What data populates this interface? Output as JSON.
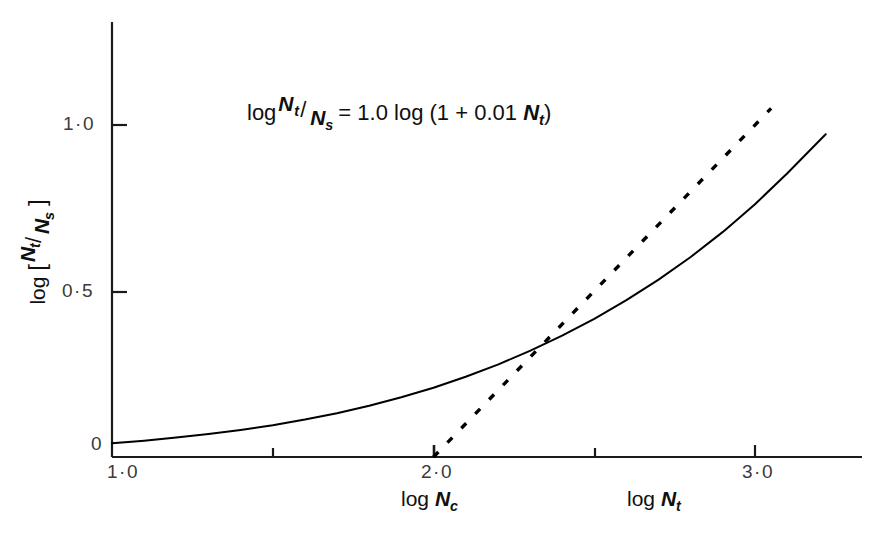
{
  "chart_data": {
    "type": "line",
    "title": "",
    "equation": {
      "lhs_log": "log",
      "lhs_num": "N",
      "lhs_num_sub": "t",
      "lhs_slash": "/",
      "lhs_den": "N",
      "lhs_den_sub": "s",
      "equals": "=",
      "coefficient": "1.0",
      "rhs_log": "log",
      "rhs_body": "(1 + 0.01 ",
      "rhs_var": "N",
      "rhs_var_sub": "t",
      "rhs_close": ")",
      "full_text": "log Nt/Ns = 1.0 log (1 + 0.01 Nt)"
    },
    "xlabel_primary": "log",
    "xlabel_primary_var": "N",
    "xlabel_primary_sub": "t",
    "xlabel_secondary": "log",
    "xlabel_secondary_var": "N",
    "xlabel_secondary_sub": "c",
    "ylabel_log": "log",
    "ylabel_open": "[",
    "ylabel_num": "N",
    "ylabel_num_sub": "t",
    "ylabel_slash": "/",
    "ylabel_den": "N",
    "ylabel_den_sub": "s",
    "ylabel_close": "]",
    "ylabel_full": "log [ Nt/Ns ]",
    "xlim": [
      1.0,
      3.22
    ],
    "ylim": [
      0.0,
      1.26
    ],
    "x_major_ticks": [
      "1·0",
      "2·0",
      "3·0"
    ],
    "x_major_values": [
      1.0,
      2.0,
      3.0
    ],
    "x_minor_values": [
      1.5,
      2.5
    ],
    "y_major_ticks": [
      "0",
      "0·5",
      "1·0"
    ],
    "y_major_values": [
      0.0,
      0.5,
      1.0
    ],
    "grid": false,
    "legend": "none",
    "series": [
      {
        "name": "log(1 + 0.01 Nt)",
        "style": "solid",
        "color": "#000000",
        "x": [
          1.0,
          1.1,
          1.2,
          1.3,
          1.4,
          1.5,
          1.6,
          1.7,
          1.8,
          1.9,
          2.0,
          2.1,
          2.2,
          2.3,
          2.4,
          2.5,
          2.6,
          2.7,
          2.8,
          2.9,
          3.0,
          3.1,
          3.22
        ],
        "values": [
          0.0414,
          0.0492,
          0.0583,
          0.0689,
          0.0813,
          0.0958,
          0.1126,
          0.1319,
          0.1542,
          0.1797,
          0.2087,
          0.2415,
          0.2784,
          0.3196,
          0.3655,
          0.4162,
          0.4723,
          0.5342,
          0.6025,
          0.6779,
          0.7614,
          0.8539,
          0.9722
        ]
      },
      {
        "name": "asymptote",
        "style": "dashed",
        "color": "#000000",
        "x": [
          2.0,
          2.2,
          2.4,
          2.6,
          2.8,
          3.0,
          3.05
        ],
        "values": [
          0.0,
          0.2,
          0.4,
          0.6,
          0.8,
          1.0,
          1.05
        ]
      }
    ],
    "annotations": [
      {
        "text": "log Nt/Ns = 1.0 log (1 + 0.01 Nt)",
        "x": 1.42,
        "y": 1.06
      }
    ]
  },
  "colors": {
    "line": "#000000",
    "axis": "#1a1a1a",
    "tick_text": "#3a3a3a",
    "background": "#ffffff"
  }
}
